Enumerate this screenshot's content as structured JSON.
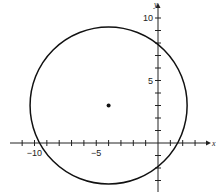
{
  "chart_data": {
    "type": "scatter",
    "title": "",
    "xlabel": "x",
    "ylabel": "y",
    "xlim": [
      -12,
      4
    ],
    "ylim": [
      -4,
      11
    ],
    "grid": false,
    "x_ticks": [
      -11,
      -10,
      -9,
      -8,
      -7,
      -6,
      -5,
      -4,
      -3,
      -2,
      -1,
      1,
      2,
      3
    ],
    "y_ticks": [
      -3,
      -2,
      -1,
      1,
      2,
      3,
      4,
      5,
      6,
      7,
      8,
      9,
      10
    ],
    "x_tick_labels": [
      {
        "value": -10,
        "label": "−10"
      },
      {
        "value": -5,
        "label": "−5"
      }
    ],
    "y_tick_labels": [
      {
        "value": 10,
        "label": "10"
      },
      {
        "value": 5,
        "label": "5"
      }
    ],
    "circle": {
      "center": [
        -4,
        3
      ],
      "radius": 6.32,
      "equation": "(x+4)^2 + (y-3)^2 = 40"
    },
    "points": [
      {
        "x": -4,
        "y": 3,
        "label": "center"
      }
    ]
  },
  "axes": {
    "x_name": "x",
    "y_name": "y"
  }
}
